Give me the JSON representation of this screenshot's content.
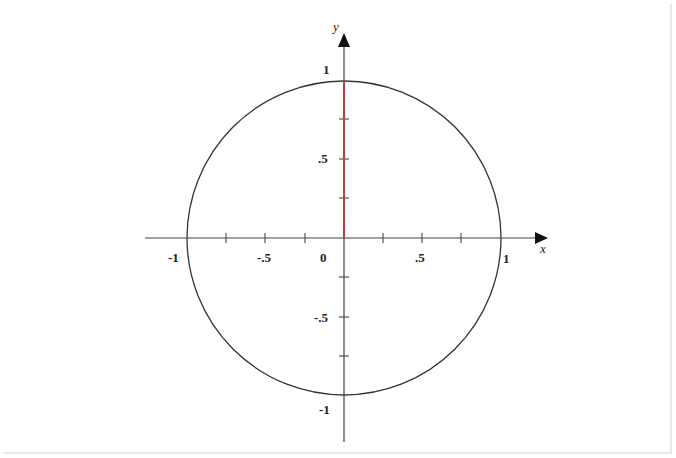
{
  "diagram": {
    "axes": {
      "x_label": "x",
      "y_label": "y",
      "x_tick_labels": [
        "-1",
        "-.5",
        "0",
        ".5",
        "1"
      ],
      "y_tick_labels": [
        "1",
        ".5",
        "-.5",
        "-1"
      ],
      "tick_step": 0.25,
      "range": [
        -1,
        1
      ]
    },
    "circle": {
      "center": [
        0,
        0
      ],
      "radius": 1,
      "color": "#333333"
    },
    "segment": {
      "from": [
        0,
        0
      ],
      "to": [
        0,
        1
      ],
      "color": "#c0392b"
    },
    "colors": {
      "axis": "#444444",
      "segment": "#c0392b",
      "background": "#ffffff"
    }
  }
}
